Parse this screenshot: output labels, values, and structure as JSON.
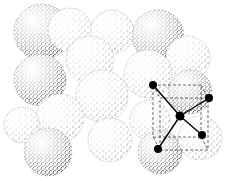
{
  "figure": {
    "background": "#ffffff",
    "ink": "#111111",
    "spheres": [
      {
        "cx": 42,
        "cy": 32,
        "r": 28
      },
      {
        "cx": 70,
        "cy": 30,
        "r": 22
      },
      {
        "cx": 112,
        "cy": 32,
        "r": 22
      },
      {
        "cx": 158,
        "cy": 36,
        "r": 26
      },
      {
        "cx": 188,
        "cy": 58,
        "r": 22
      },
      {
        "cx": 90,
        "cy": 60,
        "r": 24
      },
      {
        "cx": 40,
        "cy": 80,
        "r": 26
      },
      {
        "cx": 102,
        "cy": 96,
        "r": 26
      },
      {
        "cx": 148,
        "cy": 74,
        "r": 24
      },
      {
        "cx": 190,
        "cy": 92,
        "r": 22
      },
      {
        "cx": 60,
        "cy": 118,
        "r": 24
      },
      {
        "cx": 22,
        "cy": 125,
        "r": 18
      },
      {
        "cx": 48,
        "cy": 152,
        "r": 24
      },
      {
        "cx": 110,
        "cy": 140,
        "r": 22
      },
      {
        "cx": 150,
        "cy": 120,
        "r": 20
      },
      {
        "cx": 160,
        "cy": 152,
        "r": 22
      },
      {
        "cx": 200,
        "cy": 138,
        "r": 22
      }
    ],
    "atoms": [
      {
        "id": "a1",
        "x": 153,
        "y": 85
      },
      {
        "id": "a2",
        "x": 209,
        "y": 98
      },
      {
        "id": "center",
        "x": 180,
        "y": 116
      },
      {
        "id": "a3",
        "x": 202,
        "y": 135
      },
      {
        "id": "a4",
        "x": 158,
        "y": 149
      }
    ],
    "bonds": [
      [
        "center",
        "a1"
      ],
      [
        "center",
        "a2"
      ],
      [
        "center",
        "a3"
      ],
      [
        "center",
        "a4"
      ]
    ],
    "dashed_cube": {
      "front": {
        "x": 160,
        "y": 98,
        "w": 48,
        "h": 52
      },
      "back": {
        "x": 153,
        "y": 85,
        "w": 48,
        "h": 52
      }
    }
  }
}
